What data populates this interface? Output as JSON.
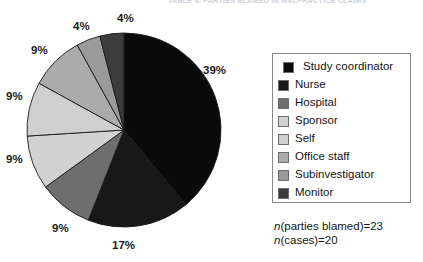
{
  "running_header": {
    "text": "TABLE 4. PARTIES BLAMED IN MALPRACTICE CLAIMS"
  },
  "chart_data": {
    "type": "pie",
    "title": "",
    "legend_position": "right",
    "grid": false,
    "units": "percent",
    "categories": [
      "Study coordinator",
      "Nurse",
      "Hospital",
      "Sponsor",
      "Self",
      "Office staff",
      "Subinvestigator",
      "Monitor"
    ],
    "values": [
      39,
      17,
      9,
      9,
      9,
      9,
      4,
      4
    ],
    "value_labels": [
      "39%",
      "17%",
      "9%",
      "9%",
      "9%",
      "9%",
      "4%",
      "4%"
    ],
    "colors": [
      "#0a0a0a",
      "#181818",
      "#6e6e6e",
      "#d2d2d2",
      "#cfcfcf",
      "#ababab",
      "#9a9a9a",
      "#3c3c3c"
    ],
    "slice_border_color": "#1a1a1a",
    "start_angle_deg": 0,
    "direction": "clockwise",
    "annotations": [
      "n(parties blamed)=23",
      "n(cases)=20"
    ]
  },
  "legend": {
    "items": [
      {
        "label": "Study coordinator",
        "color": "#0a0a0a",
        "indent": true
      },
      {
        "label": "Nurse",
        "color": "#181818",
        "indent": false
      },
      {
        "label": "Hospital",
        "color": "#6e6e6e",
        "indent": false
      },
      {
        "label": "Sponsor",
        "color": "#d2d2d2",
        "indent": false
      },
      {
        "label": "Self",
        "color": "#cfcfcf",
        "indent": false
      },
      {
        "label": "Office staff",
        "color": "#ababab",
        "indent": false
      },
      {
        "label": "Subinvestigator",
        "color": "#9a9a9a",
        "indent": false
      },
      {
        "label": "Monitor",
        "color": "#3c3c3c",
        "indent": false
      }
    ]
  },
  "annotation": {
    "line1_var": "n",
    "line1_rest": "(parties blamed)=23",
    "line2_var": "n",
    "line2_rest": "(cases)=20"
  },
  "percent_labels": [
    {
      "text": "39%",
      "left": 203,
      "top": 64
    },
    {
      "text": "17%",
      "left": 112,
      "top": 239
    },
    {
      "text": "9%",
      "left": 52,
      "top": 222
    },
    {
      "text": "9%",
      "left": 6,
      "top": 153
    },
    {
      "text": "9%",
      "left": 6,
      "top": 90
    },
    {
      "text": "9%",
      "left": 31,
      "top": 44
    },
    {
      "text": "4%",
      "left": 73,
      "top": 20
    },
    {
      "text": "4%",
      "left": 117,
      "top": 12
    }
  ]
}
